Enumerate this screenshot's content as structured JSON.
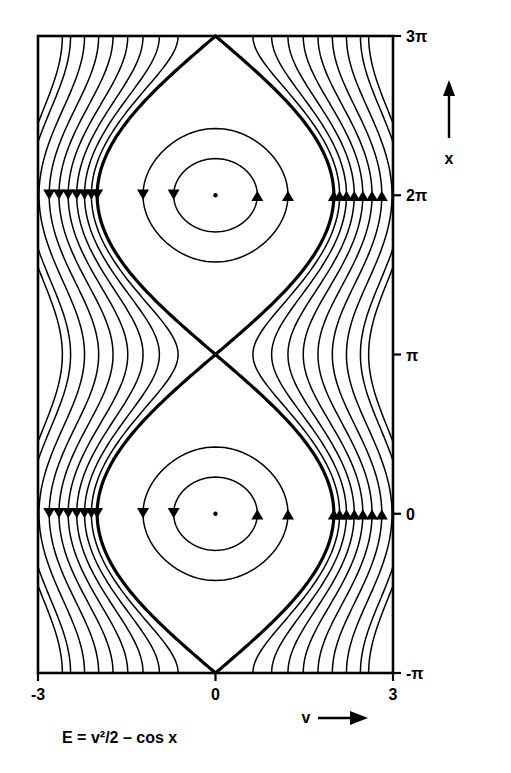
{
  "figure": {
    "title": "",
    "caption": "E = v²/2 – cos x",
    "background": "#ffffff",
    "ink_color": "#000000"
  },
  "axes": {
    "x_axis": {
      "label": "v",
      "arrow": "→",
      "ticks": [
        "-3",
        "0",
        "3"
      ],
      "tick_values": [
        -3,
        0,
        3
      ],
      "range": [
        -3,
        3
      ]
    },
    "y_axis": {
      "label": "x",
      "arrow": "↑",
      "ticks": [
        "3π",
        "2π",
        "π",
        "0",
        "-π"
      ],
      "tick_values": [
        9.4248,
        6.2832,
        3.1416,
        0,
        -3.1416
      ],
      "range": [
        -3.1416,
        9.4248
      ]
    }
  },
  "chart_data": {
    "type": "line",
    "title": "",
    "subtitle": "",
    "xlabel": "v",
    "ylabel": "x",
    "xlim": [
      -3,
      3
    ],
    "ylim": [
      -3.1416,
      9.4248
    ],
    "grid": false,
    "legend": "none",
    "plot_kind": "phase-portrait-contours",
    "equation": "E = v^2/2 - cos(x)",
    "contour_levels_libration": [
      -0.75,
      -0.25
    ],
    "contour_level_separatrix": 1.0,
    "contour_levels_rotation": [
      1.2,
      1.45,
      1.75,
      2.1,
      2.5,
      2.95,
      3.45,
      4.0,
      4.35
    ],
    "fixed_points": [
      {
        "name": "center",
        "v": 0,
        "x": 0,
        "type": "elliptic"
      },
      {
        "name": "center",
        "v": 0,
        "x": 6.2832,
        "type": "elliptic"
      },
      {
        "name": "saddle",
        "v": 0,
        "x": 3.1416,
        "type": "hyperbolic"
      },
      {
        "name": "saddle",
        "v": 0,
        "x": -3.1416,
        "type": "hyperbolic"
      },
      {
        "name": "saddle",
        "v": 0,
        "x": 9.4248,
        "type": "hyperbolic"
      }
    ],
    "flow_direction_markers": [
      {
        "at_x": 0,
        "side": "left",
        "direction": "down"
      },
      {
        "at_x": 0,
        "side": "right",
        "direction": "up"
      },
      {
        "at_x": 6.2832,
        "side": "left",
        "direction": "down"
      },
      {
        "at_x": 6.2832,
        "side": "right",
        "direction": "up"
      }
    ]
  }
}
